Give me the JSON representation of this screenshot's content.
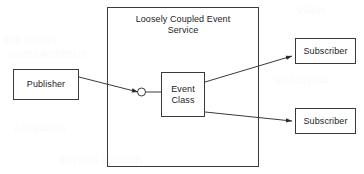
{
  "diagram": {
    "title": "Loosely Coupled Event Service",
    "container": {
      "label": "Loosely Coupled Event\nService",
      "name": "loosely-coupled-event-service"
    },
    "nodes": {
      "publisher": {
        "label": "Publisher"
      },
      "event_class": {
        "label": "Event\nClass"
      },
      "subscriber_1": {
        "label": "Subscriber"
      },
      "subscriber_2": {
        "label": "Subscriber"
      }
    },
    "connectors": [
      {
        "id": "publisher-to-event-class",
        "from": "publisher",
        "to": "event_class",
        "marker": "arrow-with-circle"
      },
      {
        "id": "event-class-to-subscriber-1",
        "from": "event_class",
        "to": "subscriber_1",
        "marker": "arrow"
      },
      {
        "id": "event-class-to-subscriber-2",
        "from": "event_class",
        "to": "subscriber_2",
        "marker": "arrow"
      }
    ],
    "colors": {
      "stroke": "#3a3a3a",
      "text": "#1c1c1c",
      "background": "#ffffff",
      "ghost": "#fbfbfb"
    },
    "background_ghost_text": [
      "view",
      "sit amet",
      "consectetur",
      "volutpat",
      "aliquam",
      "lorem ipsum"
    ]
  }
}
